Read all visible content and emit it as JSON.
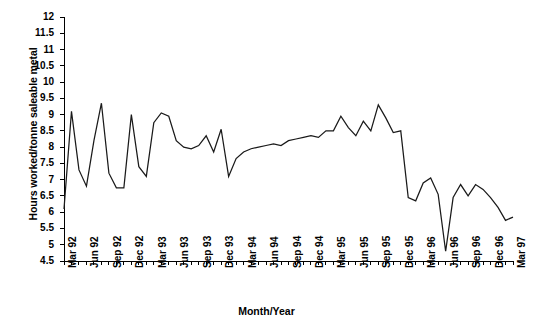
{
  "chart_data": {
    "type": "line",
    "title": "",
    "xlabel": "Month/Year",
    "ylabel": "Hours worked/tonne saleable metal",
    "ylim": [
      4.5,
      12
    ],
    "ytick_step": 0.5,
    "yticks": [
      "4.5",
      "5",
      "5.5",
      "6",
      "6.5",
      "7",
      "7.5",
      "8",
      "8.5",
      "9",
      "9.5",
      "10",
      "10.5",
      "11",
      "11.5",
      "12"
    ],
    "grid": false,
    "legend": "none",
    "xtick_labels": [
      "Mar 92",
      "Jun 92",
      "Sep 92",
      "Dec 92",
      "Mar 93",
      "Jun 93",
      "Sep 93",
      "Dec 93",
      "Mar 94",
      "Jun 94",
      "Sep 94",
      "Dec 94",
      "Mar 95",
      "Jun 95",
      "Sep 95",
      "Dec 95",
      "Mar 96",
      "Jun 96",
      "Sep 96",
      "Dec 96",
      "Mar 97"
    ],
    "xtick_every_n_points": 3,
    "x": [
      "Mar 92",
      "Apr 92",
      "May 92",
      "Jun 92",
      "Jul 92",
      "Aug 92",
      "Sep 92",
      "Oct 92",
      "Nov 92",
      "Dec 92",
      "Jan 93",
      "Feb 93",
      "Mar 93",
      "Apr 93",
      "May 93",
      "Jun 93",
      "Jul 93",
      "Aug 93",
      "Sep 93",
      "Oct 93",
      "Nov 93",
      "Dec 93",
      "Jan 94",
      "Feb 94",
      "Mar 94",
      "Apr 94",
      "May 94",
      "Jun 94",
      "Jul 94",
      "Aug 94",
      "Sep 94",
      "Oct 94",
      "Nov 94",
      "Dec 94",
      "Jan 95",
      "Feb 95",
      "Mar 95",
      "Apr 95",
      "May 95",
      "Jun 95",
      "Jul 95",
      "Aug 95",
      "Sep 95",
      "Oct 95",
      "Nov 95",
      "Dec 95",
      "Jan 96",
      "Feb 96",
      "Mar 96",
      "Apr 96",
      "May 96",
      "Jun 96",
      "Jul 96",
      "Aug 96",
      "Sep 96",
      "Oct 96",
      "Nov 96",
      "Dec 96",
      "Jan 97",
      "Feb 97",
      "Mar 97"
    ],
    "values": [
      6.1,
      9.1,
      7.3,
      6.8,
      8.2,
      9.35,
      7.2,
      6.75,
      6.75,
      9.0,
      7.4,
      7.1,
      8.75,
      9.05,
      8.95,
      8.2,
      8.0,
      7.95,
      8.05,
      8.35,
      7.85,
      8.55,
      7.1,
      7.65,
      7.85,
      7.95,
      8.0,
      8.05,
      8.1,
      8.05,
      8.2,
      8.25,
      8.3,
      8.35,
      8.3,
      8.5,
      8.5,
      8.95,
      8.6,
      8.35,
      8.8,
      8.5,
      9.3,
      8.9,
      8.45,
      8.5,
      6.45,
      6.35,
      6.9,
      7.05,
      6.55,
      4.8,
      6.45,
      6.85,
      6.5,
      6.85,
      6.7,
      6.45,
      6.15,
      5.75,
      5.85
    ],
    "series_name": "Hours worked per tonne saleable metal",
    "line_color": "#1a1a1a",
    "axis_color": "#000000",
    "background": "#ffffff"
  }
}
